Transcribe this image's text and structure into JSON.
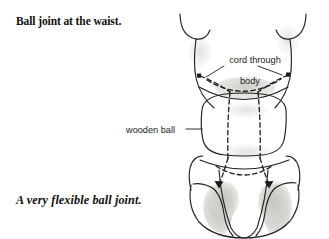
{
  "page": {
    "width": 329,
    "height": 239,
    "background": "#ffffff",
    "ink": "#1a1a1a",
    "shade": "#c9c9c4"
  },
  "heading": {
    "text": "Ball joint at the waist."
  },
  "caption": {
    "text": "A very flexible ball joint."
  },
  "annotations": {
    "cord": {
      "line1": "cord through",
      "line2": "body"
    },
    "wooden_ball": {
      "text": "wooden ball",
      "leader_dash": "—"
    }
  },
  "figure": {
    "parts": [
      "left-arm-stub",
      "right-arm-stub",
      "upper-torso",
      "wooden-ball",
      "hip-block",
      "left-leg",
      "right-leg",
      "center-panel"
    ],
    "cord_paths": [
      "left-anchor-to-center",
      "right-anchor-to-center",
      "waist-curve",
      "through-ball-left",
      "through-ball-right",
      "hip-left-arrow",
      "hip-right-arrow"
    ]
  }
}
